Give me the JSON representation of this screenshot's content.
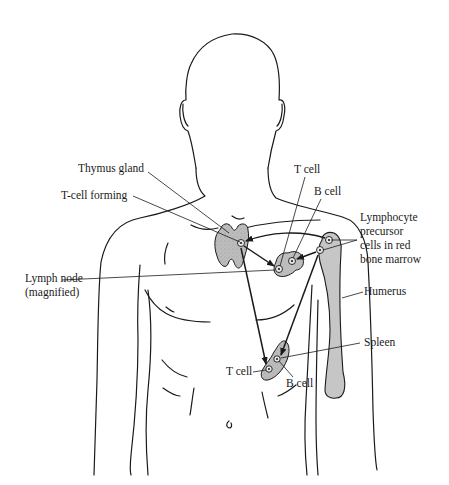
{
  "figure": {
    "colors": {
      "outline": "#1a1a1a",
      "organ_fill": "#b9b9b9",
      "bone_fill": "#c4c4c4"
    }
  },
  "labels": {
    "thymus_gland": "Thymus gland",
    "t_cell_forming": "T-cell forming",
    "lymph_node_line1": "Lymph node",
    "lymph_node_line2": "(magnified)",
    "t_cell_top": "T cell",
    "b_cell_top": "B cell",
    "precursor_line1": "Lymphocyte",
    "precursor_line2": "precursor",
    "precursor_line3": "cells in red",
    "precursor_line4": "bone marrow",
    "humerus": "Humerus",
    "spleen": "Spleen",
    "t_cell_bottom": "T cell",
    "b_cell_bottom": "B cell"
  },
  "structures": [
    {
      "name": "thymus-gland"
    },
    {
      "name": "lymph-node"
    },
    {
      "name": "humerus"
    },
    {
      "name": "spleen"
    }
  ],
  "arrows": [
    {
      "from": "bone-marrow",
      "to": "thymus-gland"
    },
    {
      "from": "thymus-gland",
      "to": "lymph-node"
    },
    {
      "from": "bone-marrow",
      "to": "lymph-node"
    },
    {
      "from": "thymus-gland",
      "to": "spleen"
    },
    {
      "from": "bone-marrow",
      "to": "spleen"
    }
  ]
}
